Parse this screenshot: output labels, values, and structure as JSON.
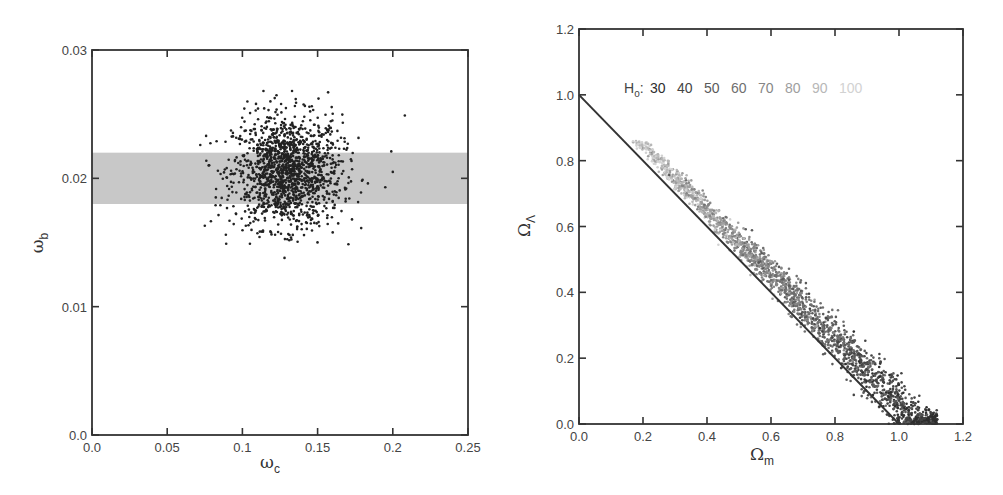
{
  "chart_data": [
    {
      "id": "left",
      "type": "scatter",
      "title": "",
      "xlabel": "ω_c",
      "xlabel_symbol": "ω",
      "xlabel_sub": "c",
      "ylabel": "ω_b",
      "ylabel_symbol": "ω",
      "ylabel_sub": "b",
      "xlim": [
        0.0,
        0.25
      ],
      "ylim": [
        0.0,
        0.03
      ],
      "xticks": [
        0.0,
        0.05,
        0.1,
        0.15,
        0.2,
        0.25
      ],
      "xtick_labels": [
        "0.0",
        "0.05",
        "0.1",
        "0.15",
        "0.2",
        "0.25"
      ],
      "yticks": [
        0.0,
        0.01,
        0.02,
        0.03
      ],
      "ytick_labels": [
        "0.0",
        "0.01",
        "0.02",
        "0.03"
      ],
      "grid": false,
      "legend": null,
      "shaded_band": {
        "ymin": 0.018,
        "ymax": 0.022,
        "color": "#c8c8c8",
        "label": ""
      },
      "series": [
        {
          "name": "samples",
          "color": "#222222",
          "point_count_approx": 1500,
          "center": {
            "x": 0.13,
            "y": 0.0205
          },
          "spread_sd": {
            "x": 0.018,
            "y": 0.0022
          },
          "x_range_approx": [
            0.073,
            0.208
          ],
          "y_range_approx": [
            0.0138,
            0.0268
          ],
          "points_note": "Approximate reconstruction: the scatter's center, spread and outliers are estimated from the image; individual dots are not readable.",
          "outliers": [
            {
              "x": 0.072,
              "y": 0.0226
            },
            {
              "x": 0.075,
              "y": 0.0163
            },
            {
              "x": 0.089,
              "y": 0.0156
            },
            {
              "x": 0.105,
              "y": 0.0149
            },
            {
              "x": 0.128,
              "y": 0.0138
            },
            {
              "x": 0.208,
              "y": 0.0249
            },
            {
              "x": 0.199,
              "y": 0.0221
            },
            {
              "x": 0.2,
              "y": 0.0205
            },
            {
              "x": 0.195,
              "y": 0.0193
            },
            {
              "x": 0.114,
              "y": 0.0268
            },
            {
              "x": 0.157,
              "y": 0.0267
            },
            {
              "x": 0.133,
              "y": 0.0268
            }
          ]
        }
      ]
    },
    {
      "id": "right",
      "type": "scatter",
      "title": "",
      "xlabel": "Ω_m",
      "xlabel_symbol": "Ω",
      "xlabel_sub": "m",
      "ylabel": "Ω_Λ",
      "ylabel_symbol": "Ω",
      "ylabel_sub": "Λ",
      "xlim": [
        0.0,
        1.2
      ],
      "ylim": [
        0.0,
        1.2
      ],
      "xticks": [
        0.0,
        0.2,
        0.4,
        0.6,
        0.8,
        1.0,
        1.2
      ],
      "xtick_labels": [
        "0.0",
        "0.2",
        "0.4",
        "0.6",
        "0.8",
        "1.0",
        "1.2"
      ],
      "yticks": [
        0.0,
        0.2,
        0.4,
        0.6,
        0.8,
        1.0,
        1.2
      ],
      "ytick_labels": [
        "0.0",
        "0.2",
        "0.4",
        "0.6",
        "0.8",
        "1.0",
        "1.2"
      ],
      "grid": false,
      "reference_line": {
        "label": "Ω_m + Ω_Λ = 1",
        "x": [
          0.0,
          1.0
        ],
        "y": [
          1.0,
          0.0
        ],
        "color": "#333333"
      },
      "legend": {
        "position": "upper-center",
        "title": "H",
        "title_sub": "o",
        "title_suffix": ":",
        "entries": [
          {
            "label": "30",
            "color": "#2e2e2e"
          },
          {
            "label": "40",
            "color": "#444444"
          },
          {
            "label": "50",
            "color": "#5a5a5a"
          },
          {
            "label": "60",
            "color": "#6f6f6f"
          },
          {
            "label": "70",
            "color": "#868686"
          },
          {
            "label": "80",
            "color": "#9e9e9e"
          },
          {
            "label": "90",
            "color": "#b7b7b7"
          },
          {
            "label": "100",
            "color": "#d2d2d2"
          }
        ]
      },
      "series": [
        {
          "name": "samples colored by H_o",
          "point_count_approx": 2000,
          "band_description": "Points lie in a band just above the line Ω_m + Ω_Λ = 1, from (0.15, 0.83) to (1.12, 0.0), widening toward larger Ω_m",
          "color_gradient": "Lighter points (higher H_o, ~90-100) cluster at low Ω_m ~0.15-0.3; darker points (lower H_o, ~30-40) at high Ω_m ~0.8-1.1",
          "points_note": "Approximate reconstruction: the band's extent and gradient are estimated from the image; individual dots are not readable.",
          "approx_band_centerline": [
            {
              "x": 0.15,
              "y": 0.82
            },
            {
              "x": 0.3,
              "y": 0.69
            },
            {
              "x": 0.45,
              "y": 0.56
            },
            {
              "x": 0.6,
              "y": 0.44
            },
            {
              "x": 0.75,
              "y": 0.31
            },
            {
              "x": 0.9,
              "y": 0.19
            },
            {
              "x": 1.0,
              "y": 0.11
            },
            {
              "x": 1.1,
              "y": 0.02
            }
          ]
        }
      ]
    }
  ]
}
